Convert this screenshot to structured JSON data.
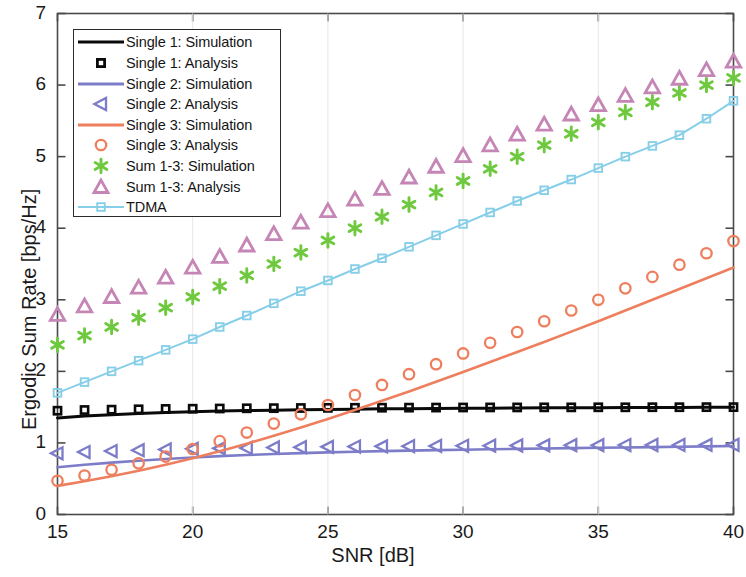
{
  "chart_data": {
    "type": "line",
    "title": "",
    "xlabel": "SNR [dB]",
    "ylabel": "Ergodic Sum Rate [bps/Hz]",
    "xlim": [
      15,
      40
    ],
    "ylim": [
      0,
      7
    ],
    "xticks": [
      15,
      20,
      25,
      30,
      35,
      40
    ],
    "yticks": [
      0,
      1,
      2,
      3,
      4,
      5,
      6,
      7
    ],
    "xtick_labels": [
      "15",
      "20",
      "25",
      "30",
      "35",
      "40"
    ],
    "ytick_labels": [
      "0",
      "1",
      "2",
      "3",
      "4",
      "5",
      "6",
      "7"
    ],
    "grid": false,
    "legend_position": "upper left",
    "x": [
      15,
      16,
      17,
      18,
      19,
      20,
      21,
      22,
      23,
      24,
      25,
      26,
      27,
      28,
      29,
      30,
      31,
      32,
      33,
      34,
      35,
      36,
      37,
      38,
      39,
      40
    ],
    "series": [
      {
        "name": "Single 1: Simulation",
        "style": "line",
        "color": "#0a0a0a",
        "values": [
          1.35,
          1.375,
          1.395,
          1.41,
          1.425,
          1.435,
          1.445,
          1.452,
          1.458,
          1.463,
          1.468,
          1.472,
          1.476,
          1.479,
          1.482,
          1.484,
          1.486,
          1.488,
          1.49,
          1.492,
          1.493,
          1.494,
          1.495,
          1.496,
          1.497,
          1.498
        ]
      },
      {
        "name": "Single 1: Analysis",
        "style": "marker",
        "marker": "square",
        "color": "#0a0a0a",
        "values": [
          1.45,
          1.46,
          1.465,
          1.47,
          1.475,
          1.478,
          1.481,
          1.484,
          1.486,
          1.488,
          1.49,
          1.491,
          1.492,
          1.493,
          1.494,
          1.495,
          1.496,
          1.496,
          1.497,
          1.497,
          1.498,
          1.498,
          1.499,
          1.499,
          1.5,
          1.5
        ]
      },
      {
        "name": "Single 2: Simulation",
        "style": "line",
        "color": "#7C7CC8",
        "values": [
          0.66,
          0.695,
          0.725,
          0.752,
          0.776,
          0.797,
          0.815,
          0.831,
          0.845,
          0.857,
          0.868,
          0.877,
          0.885,
          0.892,
          0.899,
          0.905,
          0.911,
          0.917,
          0.922,
          0.927,
          0.932,
          0.937,
          0.942,
          0.947,
          0.952,
          0.958
        ]
      },
      {
        "name": "Single 2: Analysis",
        "style": "marker",
        "marker": "triangle-left",
        "color": "#7C7CC8",
        "values": [
          0.855,
          0.872,
          0.886,
          0.898,
          0.908,
          0.917,
          0.924,
          0.93,
          0.936,
          0.941,
          0.945,
          0.949,
          0.952,
          0.955,
          0.958,
          0.96,
          0.962,
          0.964,
          0.966,
          0.968,
          0.969,
          0.97,
          0.971,
          0.972,
          0.973,
          0.974
        ]
      },
      {
        "name": "Single 3: Simulation",
        "style": "line",
        "color": "#EE7F5E",
        "values": [
          0.4,
          0.465,
          0.535,
          0.61,
          0.695,
          0.785,
          0.885,
          0.99,
          1.1,
          1.215,
          1.335,
          1.46,
          1.59,
          1.72,
          1.855,
          1.99,
          2.13,
          2.27,
          2.41,
          2.555,
          2.7,
          2.85,
          3.0,
          3.15,
          3.3,
          3.45
        ]
      },
      {
        "name": "Single 3: Analysis",
        "style": "marker",
        "marker": "circle",
        "color": "#EE7F5E",
        "values": [
          0.47,
          0.545,
          0.625,
          0.715,
          0.81,
          0.915,
          1.025,
          1.145,
          1.27,
          1.4,
          1.53,
          1.67,
          1.81,
          1.96,
          2.1,
          2.25,
          2.4,
          2.55,
          2.7,
          2.85,
          3.0,
          3.16,
          3.32,
          3.49,
          3.65,
          3.82
        ]
      },
      {
        "name": "Sum 1-3: Simulation",
        "style": "marker",
        "marker": "asterisk",
        "color": "#6FC93F",
        "values": [
          2.37,
          2.5,
          2.62,
          2.75,
          2.89,
          3.04,
          3.19,
          3.34,
          3.5,
          3.66,
          3.83,
          4.0,
          4.16,
          4.33,
          4.5,
          4.66,
          4.83,
          5.0,
          5.16,
          5.32,
          5.48,
          5.62,
          5.76,
          5.89,
          6.0,
          6.1
        ]
      },
      {
        "name": "Sum 1-3: Analysis",
        "style": "marker",
        "marker": "triangle-up",
        "color": "#C585B5",
        "values": [
          2.79,
          2.91,
          3.04,
          3.17,
          3.31,
          3.45,
          3.6,
          3.76,
          3.92,
          4.08,
          4.24,
          4.4,
          4.55,
          4.71,
          4.86,
          5.01,
          5.16,
          5.31,
          5.45,
          5.59,
          5.72,
          5.85,
          5.97,
          6.09,
          6.21,
          6.33
        ]
      },
      {
        "name": "TDMA",
        "style": "line-marker",
        "marker": "square",
        "color": "#87CEE8",
        "values": [
          1.7,
          1.85,
          2.0,
          2.15,
          2.3,
          2.45,
          2.62,
          2.78,
          2.95,
          3.12,
          3.27,
          3.43,
          3.58,
          3.74,
          3.9,
          4.06,
          4.22,
          4.38,
          4.53,
          4.68,
          4.84,
          5.0,
          5.15,
          5.3,
          5.53,
          5.78
        ]
      }
    ]
  },
  "legend": {
    "entries": [
      {
        "label": "Single 1: Simulation",
        "kind": "line",
        "color": "#0a0a0a"
      },
      {
        "label": "Single 1: Analysis",
        "kind": "square",
        "color": "#0a0a0a"
      },
      {
        "label": "Single 2: Simulation",
        "kind": "line",
        "color": "#7C7CC8"
      },
      {
        "label": "Single 2: Analysis",
        "kind": "triangle-left",
        "color": "#7C7CC8"
      },
      {
        "label": "Single 3: Simulation",
        "kind": "line",
        "color": "#EE7F5E"
      },
      {
        "label": "Single 3: Analysis",
        "kind": "circle",
        "color": "#EE7F5E"
      },
      {
        "label": "Sum 1-3: Simulation",
        "kind": "asterisk",
        "color": "#6FC93F"
      },
      {
        "label": "Sum 1-3: Analysis",
        "kind": "triangle-up",
        "color": "#C585B5"
      },
      {
        "label": "TDMA",
        "kind": "line-square",
        "color": "#87CEE8"
      }
    ]
  },
  "colors": {
    "axis": "#4a4a4a",
    "text": "#151515",
    "background": "#ffffff",
    "single1": "#0a0a0a",
    "single2": "#7C7CC8",
    "single3": "#EE7F5E",
    "sum_sim": "#6FC93F",
    "sum_ana": "#C585B5",
    "tdma": "#87CEE8"
  }
}
